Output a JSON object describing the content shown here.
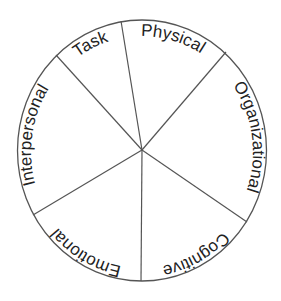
{
  "diagram": {
    "type": "segmented-wheel",
    "center": [
      142,
      150
    ],
    "radius_x": 125,
    "radius_y": 130,
    "colors": {
      "line": "#555555",
      "text": "#222222",
      "background": "#ffffff"
    },
    "segments": [
      {
        "label": "Task",
        "start_deg": 318,
        "end_deg": 350.5,
        "offset": "92.8%"
      },
      {
        "label": "Physical",
        "start_deg": 350.5,
        "end_deg": 40.6,
        "offset": "4.3%"
      },
      {
        "label": "Organizational",
        "start_deg": 40.6,
        "end_deg": 124,
        "offset": "22.8%"
      },
      {
        "label": "Cognitive",
        "start_deg": 124,
        "end_deg": 180,
        "offset": "42.2%"
      },
      {
        "label": "Emotional",
        "start_deg": 180,
        "end_deg": 239,
        "offset": "58.2%"
      },
      {
        "label": "Interpersonal",
        "start_deg": 239,
        "end_deg": 318,
        "offset": "77.4%"
      }
    ],
    "spokes": [
      {
        "between": [
          "Task",
          "Physical"
        ],
        "end": [
          121,
          22
        ]
      },
      {
        "between": [
          "Physical",
          "Organizational"
        ],
        "end": [
          226,
          52
        ]
      },
      {
        "between": [
          "Organizational",
          "Cognitive"
        ],
        "end": [
          247,
          222
        ]
      },
      {
        "between": [
          "Cognitive",
          "Emotional"
        ],
        "end": [
          141,
          281
        ]
      },
      {
        "between": [
          "Emotional",
          "Interpersonal"
        ],
        "end": [
          33,
          215
        ]
      },
      {
        "between": [
          "Interpersonal",
          "Task"
        ],
        "end": [
          56,
          55
        ]
      }
    ]
  }
}
